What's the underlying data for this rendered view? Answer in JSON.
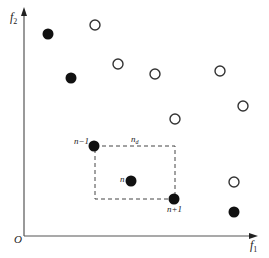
{
  "diagram": {
    "type": "objective-space crowding distance illustration",
    "axes": {
      "x_label": "f",
      "x_sub": "1",
      "y_label": "f",
      "y_sub": "2",
      "origin_label": "O"
    },
    "labels": {
      "prev": "n−1",
      "current": "n",
      "next": "n+1",
      "distance": "n",
      "distance_sub": "d"
    },
    "colors": {
      "axis": "#555555",
      "filled_point": "#111111",
      "open_point_stroke": "#333333",
      "dashed_box": "#444444"
    },
    "filled_points": [
      {
        "x": 48,
        "y": 34
      },
      {
        "x": 71,
        "y": 78
      },
      {
        "x": 94,
        "y": 146
      },
      {
        "x": 131,
        "y": 181
      },
      {
        "x": 174,
        "y": 199
      },
      {
        "x": 234,
        "y": 212
      }
    ],
    "open_points": [
      {
        "x": 95,
        "y": 25
      },
      {
        "x": 118,
        "y": 64
      },
      {
        "x": 155,
        "y": 74
      },
      {
        "x": 220,
        "y": 71
      },
      {
        "x": 175,
        "y": 119
      },
      {
        "x": 243,
        "y": 106
      },
      {
        "x": 234,
        "y": 182
      }
    ],
    "cuboid": {
      "x1": 95,
      "y1": 146,
      "x2": 175,
      "y2": 199
    }
  }
}
